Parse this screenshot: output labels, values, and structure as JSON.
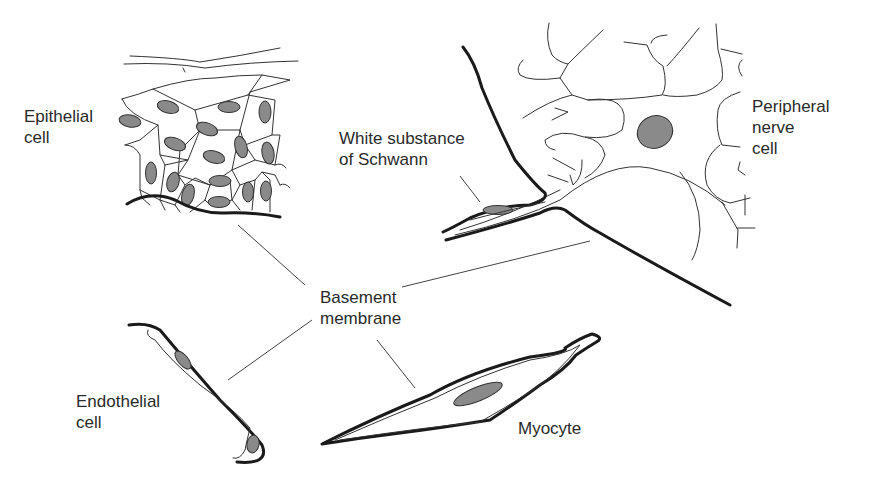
{
  "figure": {
    "type": "diagram",
    "labels": {
      "epithelial": [
        "Epithelial",
        "cell"
      ],
      "schwann": [
        "White substance",
        "of Schwann"
      ],
      "nerve": [
        "Peripheral",
        "nerve",
        "cell"
      ],
      "basement": [
        "Basement",
        "membrane"
      ],
      "endothelial": [
        "Endothelial",
        "cell"
      ],
      "myocyte": [
        "Myocyte"
      ]
    },
    "colors": {
      "line": "#1a1a1a",
      "nucleus": "#8a8a8a",
      "text": "#2a2a2a",
      "background": "#ffffff"
    }
  }
}
